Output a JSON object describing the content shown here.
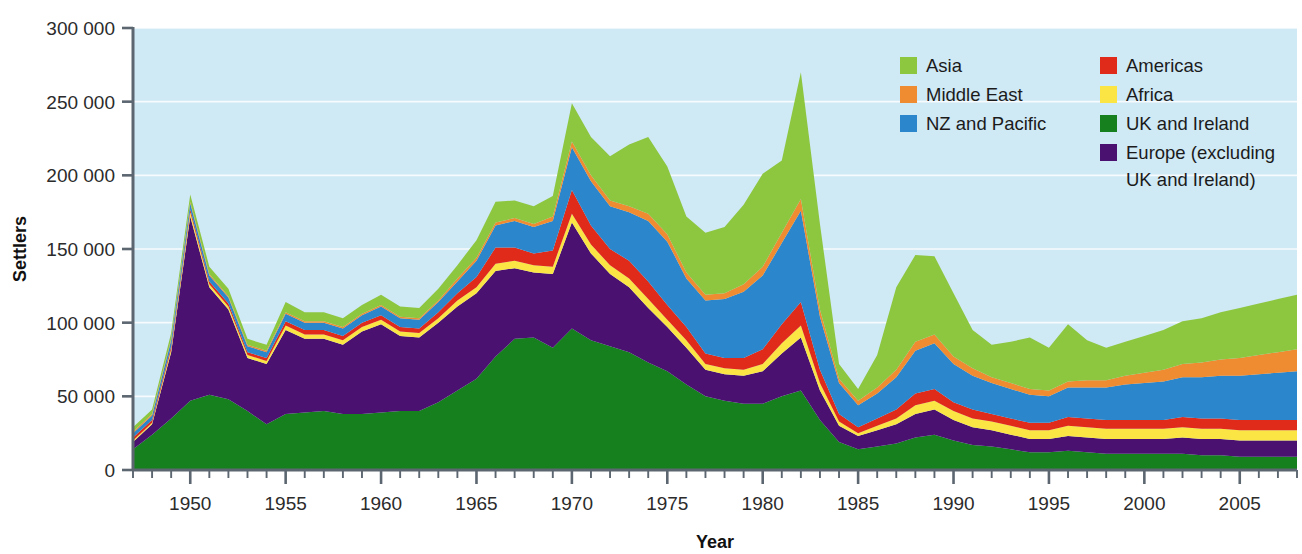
{
  "chart_data": {
    "type": "area",
    "stacked": true,
    "title": "",
    "xlabel": "Year",
    "ylabel": "Settlers",
    "xlim": [
      1947,
      2008
    ],
    "ylim": [
      0,
      300000
    ],
    "xticks": [
      1950,
      1955,
      1960,
      1965,
      1970,
      1975,
      1980,
      1985,
      1990,
      1995,
      2000,
      2005
    ],
    "xtick_labels": [
      "1950",
      "1955",
      "1960",
      "1965",
      "1970",
      "1975",
      "1980",
      "1985",
      "1990",
      "1995",
      "2000",
      "2005"
    ],
    "yticks": [
      0,
      50000,
      100000,
      150000,
      200000,
      250000,
      300000
    ],
    "ytick_labels": [
      "0",
      "50 000",
      "100 000",
      "150 000",
      "200 000",
      "250 000",
      "300 000"
    ],
    "grid": true,
    "grid_axis": "y",
    "legend_position": "upper-right",
    "plot_background": "#cfe9f5",
    "figure_background": "#ffffff",
    "x": [
      1947,
      1948,
      1949,
      1950,
      1951,
      1952,
      1953,
      1954,
      1955,
      1956,
      1957,
      1958,
      1959,
      1960,
      1961,
      1962,
      1963,
      1964,
      1965,
      1966,
      1967,
      1968,
      1969,
      1970,
      1971,
      1972,
      1973,
      1974,
      1975,
      1976,
      1977,
      1978,
      1979,
      1980,
      1981,
      1982,
      1983,
      1984,
      1985,
      1986,
      1987,
      1988,
      1989,
      1990,
      1991,
      1992,
      1993,
      1994,
      1995,
      1996,
      1997,
      1998,
      1999,
      2000,
      2001,
      2002,
      2003,
      2004,
      2005,
      2006,
      2007,
      2008
    ],
    "series": [
      {
        "name": "UK and Ireland",
        "color": "#17801e",
        "values": [
          14000,
          24000,
          35000,
          47000,
          51000,
          48000,
          40000,
          31000,
          38000,
          39000,
          40000,
          38000,
          38000,
          39000,
          40000,
          40000,
          46000,
          54000,
          62000,
          77000,
          89000,
          90000,
          83000,
          96000,
          88000,
          84000,
          80000,
          73000,
          67000,
          58000,
          50000,
          47000,
          45000,
          45000,
          50000,
          54000,
          34000,
          19000,
          14000,
          16000,
          18000,
          22000,
          24000,
          20000,
          17000,
          16000,
          14000,
          12000,
          12000,
          13000,
          12000,
          11000,
          11000,
          11000,
          11000,
          11000,
          10000,
          10000,
          9000,
          9000,
          9000,
          9000
        ]
      },
      {
        "name": "Europe (excluding UK and Ireland)",
        "color": "#4b1170",
        "values": [
          5000,
          7000,
          45000,
          125000,
          73000,
          61000,
          36000,
          41000,
          57000,
          50000,
          49000,
          47000,
          56000,
          60000,
          51000,
          50000,
          54000,
          57000,
          58000,
          58000,
          48000,
          44000,
          50000,
          72000,
          59000,
          49000,
          44000,
          37000,
          30000,
          25000,
          18000,
          18000,
          19000,
          22000,
          29000,
          36000,
          20000,
          11000,
          9000,
          11000,
          13000,
          16000,
          17000,
          14000,
          12000,
          11000,
          10000,
          9000,
          9000,
          10000,
          10000,
          10000,
          10000,
          10000,
          10000,
          11000,
          11000,
          11000,
          11000,
          11000,
          11000,
          11000
        ]
      },
      {
        "name": "Africa",
        "color": "#fbe545",
        "values": [
          1000,
          1000,
          2000,
          3000,
          2000,
          2000,
          2000,
          2000,
          3000,
          3000,
          3000,
          3000,
          3000,
          3000,
          3000,
          3000,
          3000,
          4000,
          4000,
          5000,
          5000,
          5000,
          5000,
          6000,
          6000,
          6000,
          6000,
          6000,
          5000,
          5000,
          4000,
          4000,
          4000,
          5000,
          7000,
          8000,
          5000,
          3000,
          2000,
          3000,
          4000,
          6000,
          6000,
          6000,
          6000,
          6000,
          6000,
          6000,
          6000,
          7000,
          7000,
          7000,
          7000,
          7000,
          7000,
          7000,
          7000,
          7000,
          7000,
          7000,
          7000,
          7000
        ]
      },
      {
        "name": "Americas",
        "color": "#e02b1b",
        "values": [
          2000,
          2000,
          2000,
          2000,
          2000,
          2000,
          2000,
          2000,
          3000,
          3000,
          3000,
          3000,
          3000,
          3000,
          3000,
          3000,
          4000,
          5000,
          7000,
          11000,
          9000,
          8000,
          11000,
          16000,
          13000,
          11000,
          12000,
          12000,
          10000,
          9000,
          7000,
          7000,
          8000,
          10000,
          13000,
          16000,
          9000,
          5000,
          4000,
          5000,
          6000,
          8000,
          8000,
          6000,
          6000,
          5000,
          5000,
          5000,
          5000,
          6000,
          6000,
          6000,
          6000,
          6000,
          6000,
          7000,
          7000,
          7000,
          7000,
          7000,
          7000,
          7000
        ]
      },
      {
        "name": "NZ and Pacific",
        "color": "#2b86cb",
        "values": [
          3000,
          3000,
          4000,
          4000,
          4000,
          4000,
          4000,
          4000,
          5000,
          5000,
          5000,
          5000,
          5000,
          6000,
          6000,
          6000,
          7000,
          8000,
          11000,
          15000,
          18000,
          18000,
          20000,
          29000,
          30000,
          29000,
          33000,
          41000,
          43000,
          33000,
          36000,
          40000,
          45000,
          50000,
          55000,
          62000,
          36000,
          21000,
          15000,
          17000,
          22000,
          29000,
          31000,
          26000,
          23000,
          21000,
          20000,
          19000,
          18000,
          20000,
          21000,
          22000,
          24000,
          25000,
          26000,
          27000,
          28000,
          29000,
          30000,
          31000,
          32000,
          33000
        ]
      },
      {
        "name": "Middle East",
        "color": "#ef8b31",
        "values": [
          1000,
          1000,
          1000,
          1000,
          1000,
          1000,
          1000,
          1000,
          1000,
          1000,
          1000,
          1000,
          1000,
          1000,
          1000,
          1000,
          1000,
          2000,
          2000,
          2000,
          2000,
          2000,
          3000,
          4000,
          4000,
          4000,
          4000,
          5000,
          5000,
          4000,
          4000,
          4000,
          5000,
          6000,
          7000,
          8000,
          5000,
          3000,
          3000,
          4000,
          5000,
          6000,
          6000,
          5000,
          5000,
          4000,
          4000,
          4000,
          4000,
          4000,
          5000,
          5000,
          6000,
          7000,
          8000,
          9000,
          10000,
          11000,
          12000,
          13000,
          14000,
          15000
        ]
      },
      {
        "name": "Asia",
        "color": "#8dc63f",
        "values": [
          3000,
          3000,
          4000,
          5000,
          5000,
          5000,
          4000,
          4000,
          7000,
          6000,
          6000,
          6000,
          6000,
          7000,
          7000,
          7000,
          8000,
          9000,
          12000,
          14000,
          12000,
          12000,
          14000,
          26000,
          26000,
          30000,
          42000,
          52000,
          46000,
          38000,
          42000,
          45000,
          54000,
          63000,
          49000,
          86000,
          58000,
          10000,
          8000,
          22000,
          56000,
          59000,
          53000,
          43000,
          26000,
          22000,
          28000,
          35000,
          29000,
          39000,
          27000,
          22000,
          23000,
          25000,
          27000,
          29000,
          30000,
          32000,
          34000,
          35000,
          36000,
          37000
        ]
      }
    ],
    "legend": [
      {
        "label": "Asia",
        "color": "#8dc63f"
      },
      {
        "label": "Americas",
        "color": "#e02b1b"
      },
      {
        "label": "Middle East",
        "color": "#ef8b31"
      },
      {
        "label": "Africa",
        "color": "#fbe545"
      },
      {
        "label": "NZ and Pacific",
        "color": "#2b86cb"
      },
      {
        "label": "UK and Ireland",
        "color": "#17801e"
      },
      {
        "label": "Europe (excluding",
        "color": "#4b1170"
      },
      {
        "label": "UK and Ireland)",
        "color": ""
      }
    ]
  },
  "legend_text": {
    "asia": "Asia",
    "americas": "Americas",
    "middle_east": "Middle East",
    "africa": "Africa",
    "nz_pacific": "NZ and Pacific",
    "uk_ireland": "UK and Ireland",
    "europe_line1": "Europe (excluding",
    "europe_line2": "UK and Ireland)"
  },
  "axes": {
    "y_title": "Settlers",
    "x_title": "Year"
  }
}
